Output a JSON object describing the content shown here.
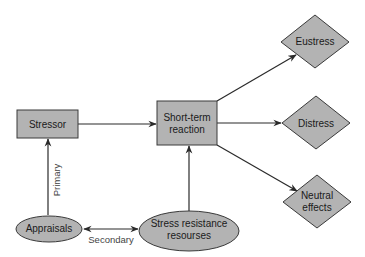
{
  "colors": {
    "node_fill": "#b3b3b3",
    "node_stroke": "#3a3a3a",
    "edge": "#2a2a2a",
    "background": "#ffffff"
  },
  "nodes": {
    "stressor": {
      "label": "Stressor",
      "shape": "rectangle"
    },
    "short_term": {
      "line1": "Short-term",
      "line2": "reaction",
      "shape": "rectangle"
    },
    "eustress": {
      "label": "Eustress",
      "shape": "diamond"
    },
    "distress": {
      "label": "Distress",
      "shape": "diamond"
    },
    "neutral": {
      "line1": "Neutral",
      "line2": "effects",
      "shape": "diamond"
    },
    "appraisals": {
      "label": "Appraisals",
      "shape": "ellipse"
    },
    "resources": {
      "line1": "Stress resistance",
      "line2": "resourses",
      "shape": "ellipse"
    }
  },
  "edges": {
    "primary": {
      "label": "Primary",
      "from": "Appraisals",
      "to": "Stressor"
    },
    "secondary": {
      "label": "Secondary",
      "from": "Appraisals",
      "to": "Stress resistance resourses",
      "bidirectional": true
    },
    "stressor_to_reaction": {
      "from": "Stressor",
      "to": "Short-term reaction"
    },
    "resources_to_reaction": {
      "from": "Stress resistance resourses",
      "to": "Short-term reaction"
    },
    "reaction_to_eustress": {
      "from": "Short-term reaction",
      "to": "Eustress"
    },
    "reaction_to_distress": {
      "from": "Short-term reaction",
      "to": "Distress"
    },
    "reaction_to_neutral": {
      "from": "Short-term reaction",
      "to": "Neutral effects"
    }
  }
}
